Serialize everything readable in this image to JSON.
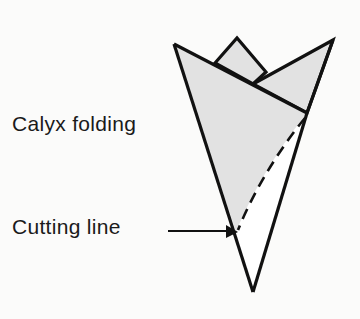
{
  "diagram": {
    "type": "illustration",
    "labels": {
      "calyx": "Calyx folding",
      "cutting": "Cutting line"
    },
    "colors": {
      "background": "#fbfbfa",
      "shade": "#e2e2e2",
      "stroke": "#111111",
      "text": "#1a1a1a"
    },
    "callouts": [
      {
        "label": "Calyx folding",
        "points_to": "left shaded flap"
      },
      {
        "label": "Cutting line",
        "points_to": "dashed curve near lower-left edge",
        "style": "arrow"
      }
    ]
  }
}
